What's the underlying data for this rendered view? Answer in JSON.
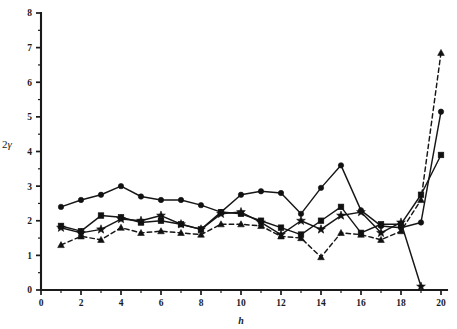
{
  "chart_data": {
    "type": "line",
    "title": "",
    "xlabel": "h",
    "ylabel": "2γ",
    "xlim": [
      0,
      20
    ],
    "ylim": [
      0,
      8
    ],
    "xticks": [
      0,
      2,
      4,
      6,
      8,
      10,
      12,
      14,
      16,
      18,
      20
    ],
    "xtick_labels": [
      "0",
      "2",
      "4",
      "6",
      "8",
      "10",
      "12",
      "14",
      "16",
      "18",
      "20"
    ],
    "xticks_minor": [
      1,
      3,
      5,
      7,
      9,
      11,
      13,
      15,
      17,
      19
    ],
    "yticks": [
      0,
      1,
      2,
      3,
      4,
      5,
      6,
      7,
      8
    ],
    "ytick_labels": [
      "0",
      "1",
      "2",
      "3",
      "4",
      "5",
      "6",
      "7",
      "8"
    ],
    "yticks_minor": [
      0.5,
      1.5,
      2.5,
      3.5,
      4.5,
      5.5,
      6.5,
      7.5
    ],
    "grid": false,
    "legend_position": "none",
    "x": [
      1,
      2,
      3,
      4,
      5,
      6,
      7,
      8,
      9,
      10,
      11,
      12,
      13,
      14,
      15,
      16,
      17,
      18,
      19,
      20
    ],
    "series": [
      {
        "name": "circle-series",
        "marker": "circle",
        "linestyle": "solid",
        "color": "#111111",
        "values": [
          2.4,
          2.6,
          2.75,
          3.0,
          2.7,
          2.6,
          2.6,
          2.45,
          2.25,
          2.75,
          2.85,
          2.8,
          2.2,
          2.95,
          3.6,
          2.3,
          1.85,
          1.8,
          1.95,
          5.15
        ]
      },
      {
        "name": "square-series",
        "marker": "square",
        "linestyle": "solid",
        "color": "#111111",
        "values": [
          1.85,
          1.7,
          2.15,
          2.1,
          1.95,
          2.0,
          1.9,
          1.75,
          2.25,
          2.2,
          2.0,
          1.8,
          1.6,
          2.0,
          2.4,
          1.65,
          1.9,
          1.9,
          2.75,
          3.9
        ]
      },
      {
        "name": "star-series",
        "marker": "star",
        "linestyle": "solid",
        "color": "#111111",
        "values": [
          1.8,
          1.65,
          1.75,
          2.05,
          2.0,
          2.15,
          1.9,
          1.75,
          2.2,
          2.25,
          1.95,
          1.6,
          2.0,
          1.75,
          2.15,
          2.25,
          1.65,
          1.95,
          0.1,
          null
        ]
      },
      {
        "name": "triangle-series",
        "marker": "triangle",
        "linestyle": "dashed",
        "color": "#111111",
        "values": [
          1.3,
          1.55,
          1.45,
          1.8,
          1.65,
          1.7,
          1.65,
          1.6,
          1.9,
          1.9,
          1.85,
          1.55,
          1.5,
          0.95,
          1.65,
          1.6,
          1.45,
          1.7,
          2.6,
          6.85
        ]
      }
    ]
  }
}
